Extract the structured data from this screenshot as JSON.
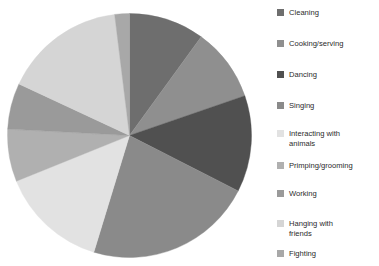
{
  "chart_data": {
    "type": "pie",
    "title": "Behaviors",
    "title_visible": false,
    "legend_position": "right",
    "grid": false,
    "categories": [
      "Cleaning",
      "Cooking/serving",
      "Dancing",
      "Singing",
      "Interacting with\nanimals",
      "Primping/grooming",
      "Working",
      "Hanging with\nfriends",
      "Fighting"
    ],
    "values": [
      10,
      10,
      13,
      22,
      14,
      7,
      6,
      16,
      2
    ],
    "percentages": [
      "10%",
      "10%",
      "13%",
      "22%",
      "14%",
      "7%",
      "6%",
      "16%",
      "2%"
    ],
    "start_angle": 0,
    "direction": "clockwise",
    "slice_angles_deg": [
      36,
      35,
      46,
      80,
      51,
      25,
      22,
      58,
      7
    ],
    "colors": [
      "#6e6e6e",
      "#8f8f8f",
      "#505050",
      "#8a8a8a",
      "#e2e2e2",
      "#b0b0b0",
      "#9a9a9a",
      "#d5d5d5",
      "#a8a8a8"
    ],
    "xlabel": "",
    "ylabel": ""
  },
  "legend": {
    "items": [
      {
        "label": "Cleaning",
        "color": "#6e6e6e"
      },
      {
        "label": "Cooking/serving",
        "color": "#8f8f8f"
      },
      {
        "label": "Dancing",
        "color": "#505050"
      },
      {
        "label": "Singing",
        "color": "#8a8a8a"
      },
      {
        "label": "Interacting with\nanimals",
        "color": "#e2e2e2"
      },
      {
        "label": "Primping/grooming",
        "color": "#b0b0b0"
      },
      {
        "label": "Working",
        "color": "#9a9a9a"
      },
      {
        "label": "Hanging with\nfriends",
        "color": "#d5d5d5"
      },
      {
        "label": "Fighting",
        "color": "#a8a8a8"
      }
    ],
    "item_tops": [
      8,
      39,
      70,
      101,
      129,
      161,
      189,
      219,
      249
    ]
  }
}
